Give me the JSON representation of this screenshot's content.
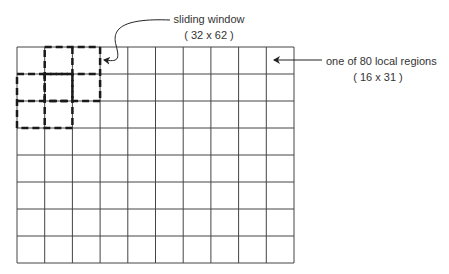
{
  "grid": {
    "columns": 10,
    "rows": 8,
    "total_regions": 80,
    "left": 17,
    "top": 47,
    "right": 294,
    "bottom": 263,
    "line_color": "#444444"
  },
  "sliding_windows": [
    {
      "col": 1,
      "row": 0,
      "span_cols": 2,
      "span_rows": 2
    },
    {
      "col": 0,
      "row": 1,
      "span_cols": 2,
      "span_rows": 2
    }
  ],
  "annotations": {
    "sliding_window": {
      "title": "sliding window",
      "size": "( 32 x 62 )"
    },
    "local_region": {
      "title": "one of 80 local regions",
      "size": "( 16 x 31 )"
    }
  }
}
